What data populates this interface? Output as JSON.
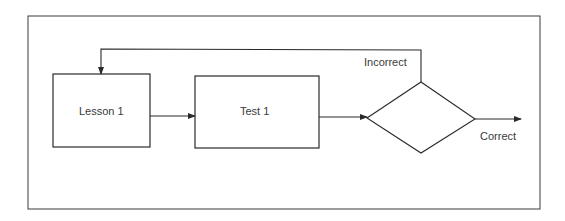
{
  "diagram": {
    "type": "flowchart",
    "colors": {
      "stroke": "#2a2a2a",
      "text": "#3a3a3a",
      "background": "#ffffff"
    },
    "nodes": [
      {
        "id": "lesson1",
        "shape": "rectangle",
        "label": "Lesson 1"
      },
      {
        "id": "test1",
        "shape": "rectangle",
        "label": "Test 1"
      },
      {
        "id": "decision",
        "shape": "diamond",
        "label": ""
      }
    ],
    "edges": [
      {
        "from": "lesson1",
        "to": "test1",
        "label": ""
      },
      {
        "from": "test1",
        "to": "decision",
        "label": ""
      },
      {
        "from": "decision",
        "to": "lesson1",
        "label": "Incorrect"
      },
      {
        "from": "decision",
        "to": "exit",
        "label": "Correct"
      }
    ]
  },
  "labels": {
    "lesson": "Lesson 1",
    "test": "Test 1",
    "incorrect": "Incorrect",
    "correct": "Correct"
  }
}
